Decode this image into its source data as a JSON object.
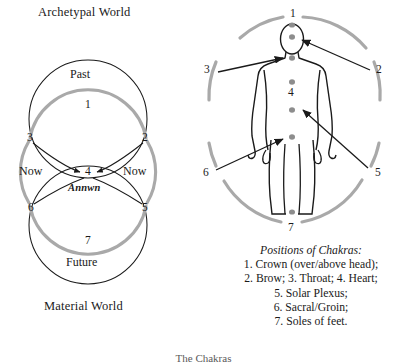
{
  "figure": {
    "caption": "The Chakras"
  },
  "left_panel": {
    "top_label": "Archetypal World",
    "bottom_label": "Material World",
    "upper_circle_label": "Past",
    "lower_circle_label": "Future",
    "center_label": "Annwn",
    "now_left": "Now",
    "now_right": "Now",
    "nodes": [
      {
        "id": "n1",
        "label": "1",
        "x": 88,
        "y": 104
      },
      {
        "id": "n2",
        "label": "2",
        "x": 145,
        "y": 138
      },
      {
        "id": "n3",
        "label": "3",
        "x": 30,
        "y": 138
      },
      {
        "id": "n4",
        "label": "4",
        "x": 89,
        "y": 172
      },
      {
        "id": "n5",
        "label": "5",
        "x": 145,
        "y": 208
      },
      {
        "id": "n6",
        "label": "6",
        "x": 31,
        "y": 208
      },
      {
        "id": "n7",
        "label": "7",
        "x": 88,
        "y": 240
      }
    ]
  },
  "right_panel": {
    "nodes": [
      {
        "id": "r1",
        "label": "1",
        "x": 295,
        "y": 16
      },
      {
        "id": "r2",
        "label": "2",
        "x": 379,
        "y": 70
      },
      {
        "id": "r3",
        "label": "3",
        "x": 207,
        "y": 70
      },
      {
        "id": "r4",
        "label": "4",
        "x": 290,
        "y": 92
      },
      {
        "id": "r5",
        "label": "5",
        "x": 378,
        "y": 173
      },
      {
        "id": "r6",
        "label": "6",
        "x": 206,
        "y": 173
      },
      {
        "id": "r7",
        "label": "7",
        "x": 291,
        "y": 228
      }
    ],
    "legend": {
      "title": "Positions of Chakras:",
      "lines": [
        "1. Crown (over/above head);",
        "2. Brow; 3. Throat; 4. Heart;",
        "5. Solar Plexus;",
        "6. Sacral/Groin;",
        "7. Soles of feet."
      ]
    }
  },
  "colors": {
    "ink": "#1a1a1a",
    "arc_gray": "#a9a9a9",
    "chakra_dot": "#8d8d8d"
  }
}
